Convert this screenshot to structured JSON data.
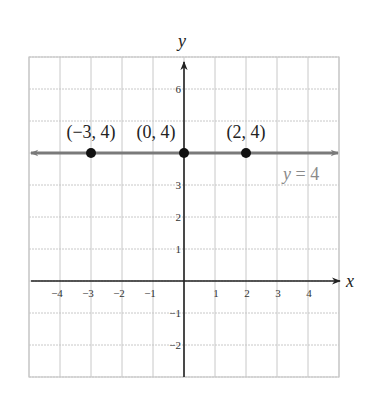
{
  "chart_data": {
    "type": "line",
    "title": "",
    "xlabel": "x",
    "ylabel": "y",
    "xlim": [
      -5,
      5
    ],
    "ylim": [
      -3,
      7
    ],
    "grid": true,
    "x_ticks": [
      -4,
      -3,
      -2,
      -1,
      1,
      2,
      3,
      4
    ],
    "x_tick_labels": [
      "−4",
      "−3",
      "−2",
      "−1",
      "1",
      "2",
      "3",
      "4"
    ],
    "y_ticks": [
      6,
      3,
      2,
      1,
      -1,
      -2
    ],
    "y_tick_labels": [
      "6",
      "3",
      "2",
      "1",
      "−1",
      "−2"
    ],
    "series": [
      {
        "name": "y = 4",
        "kind": "horizontal-line",
        "y": 4,
        "color": "#7a7a7a",
        "label": "y = 4"
      }
    ],
    "points": [
      {
        "x": -3,
        "y": 4,
        "label": "(−3, 4)"
      },
      {
        "x": 0,
        "y": 4,
        "label": "(0, 4)"
      },
      {
        "x": 2,
        "y": 4,
        "label": "(2, 4)"
      }
    ],
    "colors": {
      "grid": "#c8c8c8",
      "axis": "#222222",
      "line": "#7a7a7a",
      "point": "#111111",
      "line_label": "#8a8a8a"
    }
  }
}
